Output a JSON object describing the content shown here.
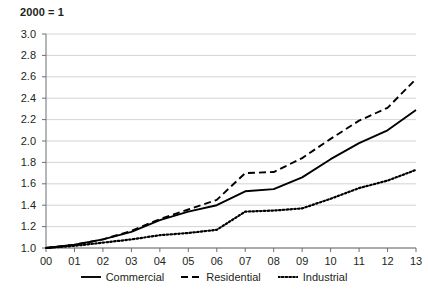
{
  "chart_data": {
    "type": "line",
    "title": "2000 = 1",
    "xlabel": "",
    "ylabel": "",
    "ylim": [
      1.0,
      3.0
    ],
    "ytick_step": 0.2,
    "grid": true,
    "legend_position": "bottom",
    "categories": [
      "00",
      "01",
      "02",
      "03",
      "04",
      "05",
      "06",
      "07",
      "08",
      "09",
      "10",
      "11",
      "12",
      "13"
    ],
    "ytick_labels": [
      "3.0",
      "2.8",
      "2.6",
      "2.4",
      "2.2",
      "2.0",
      "1.8",
      "1.6",
      "1.4",
      "1.2",
      "1.0"
    ],
    "ytick_values": [
      3.0,
      2.8,
      2.6,
      2.4,
      2.2,
      2.0,
      1.8,
      1.6,
      1.4,
      1.2,
      1.0
    ],
    "series": [
      {
        "name": "Commercial",
        "style": "solid",
        "color": "#000000",
        "values": [
          1.0,
          1.03,
          1.08,
          1.15,
          1.26,
          1.34,
          1.4,
          1.53,
          1.55,
          1.66,
          1.83,
          1.98,
          2.1,
          2.29
        ]
      },
      {
        "name": "Residential",
        "style": "dashed",
        "color": "#000000",
        "values": [
          1.0,
          1.03,
          1.08,
          1.16,
          1.27,
          1.36,
          1.45,
          1.7,
          1.71,
          1.84,
          2.02,
          2.19,
          2.31,
          2.58
        ]
      },
      {
        "name": "Industrial",
        "style": "dotted",
        "color": "#000000",
        "values": [
          1.0,
          1.02,
          1.05,
          1.08,
          1.12,
          1.14,
          1.17,
          1.34,
          1.35,
          1.37,
          1.46,
          1.56,
          1.63,
          1.73
        ]
      }
    ]
  },
  "colors": {
    "grid": "#c9c9c9",
    "axis": "#6d6e71",
    "text": "#231f20",
    "line": "#000000",
    "background": "#ffffff"
  }
}
